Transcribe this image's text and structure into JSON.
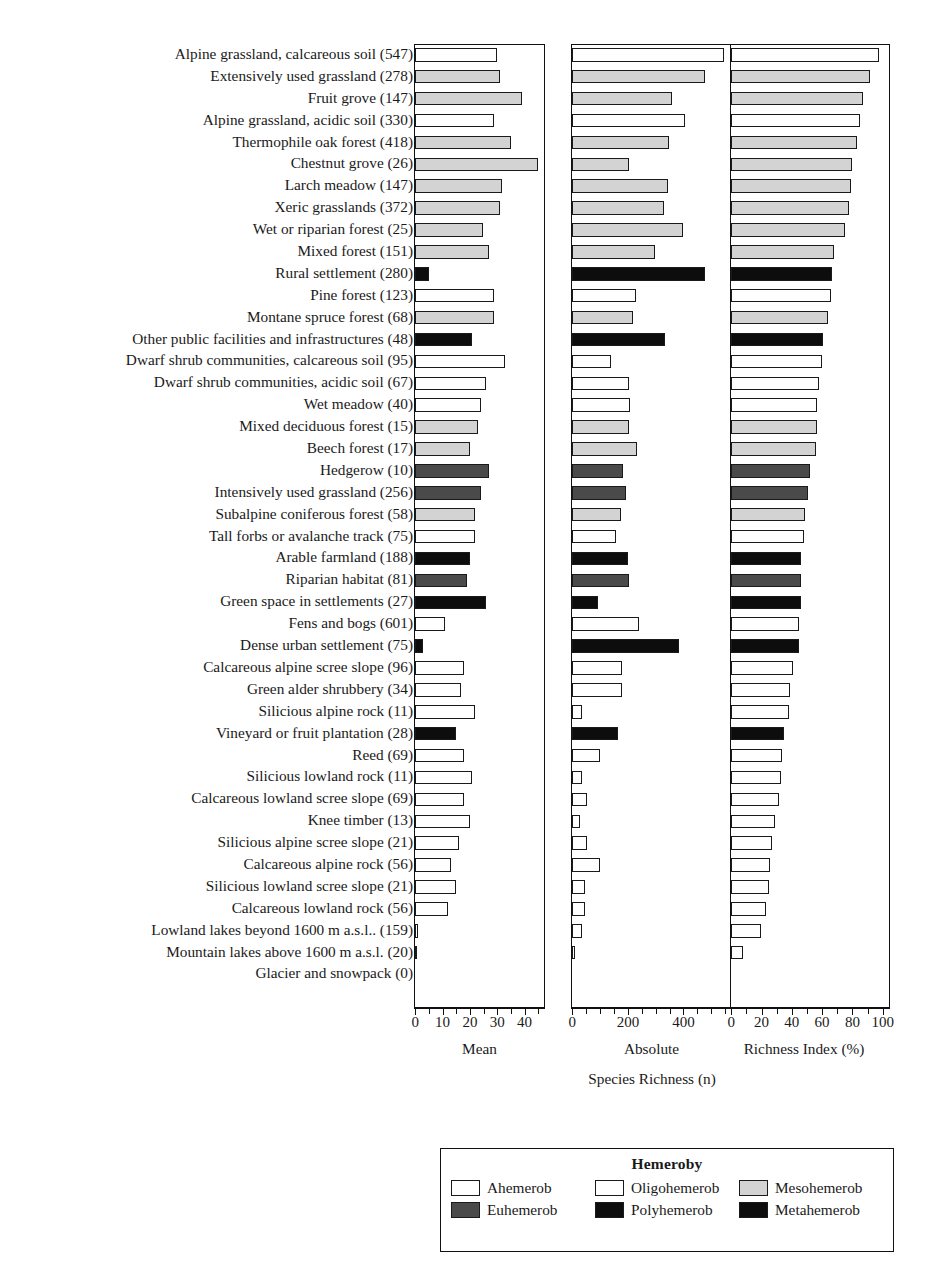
{
  "chart_data": {
    "type": "bar",
    "title": "",
    "xlabel": "Species Richness (n)",
    "ylabel": "",
    "grid": false,
    "orientation": "horizontal",
    "panels": [
      {
        "name": "Mean",
        "xlabel": "Mean",
        "xlim": [
          0,
          47
        ],
        "ticks": [
          0,
          5,
          10,
          15,
          20,
          25,
          30,
          35,
          40,
          45
        ],
        "tick_labels": [
          "0",
          "",
          "10",
          "",
          "20",
          "",
          "30",
          "",
          "40",
          ""
        ]
      },
      {
        "name": "Absolute",
        "xlabel": "Absolute",
        "xlim": [
          0,
          570
        ],
        "ticks": [
          0,
          50,
          100,
          150,
          200,
          250,
          300,
          350,
          400,
          450,
          500,
          550
        ],
        "tick_labels": [
          "0",
          "",
          "",
          "",
          "200",
          "",
          "",
          "",
          "400",
          "",
          "",
          ""
        ]
      },
      {
        "name": "Richness Index (%)",
        "xlabel": "Richness Index (%)",
        "xlim": [
          0,
          104
        ],
        "ticks": [
          0,
          10,
          20,
          30,
          40,
          50,
          60,
          70,
          80,
          90,
          100
        ],
        "tick_labels": [
          "0",
          "",
          "20",
          "",
          "40",
          "",
          "60",
          "",
          "80",
          "",
          "100"
        ]
      }
    ],
    "legend": {
      "title": "Hemeroby",
      "position": "bottom",
      "entries": [
        {
          "label": "Ahemerob",
          "key": "ahemerob",
          "color": "#ffffff"
        },
        {
          "label": "Oligohemerob",
          "key": "oligohemerob",
          "color": "#ffffff"
        },
        {
          "label": "Mesohemerob",
          "key": "mesohemerob",
          "color": "#d3d3d3"
        },
        {
          "label": "Euhemerob",
          "key": "euhemerob",
          "color": "#4a4a4a"
        },
        {
          "label": "Polyhemerob",
          "key": "polyhemerob",
          "color": "#0d0d0d"
        },
        {
          "label": "Metahemerob",
          "key": "metahemerob",
          "color": "#0d0d0d"
        }
      ]
    },
    "categories": [
      "Alpine grassland, calcareous soil (547)",
      "Extensively used grassland (278)",
      "Fruit grove (147)",
      "Alpine grassland, acidic soil (330)",
      "Thermophile oak forest (418)",
      "Chestnut grove (26)",
      "Larch meadow (147)",
      "Xeric grasslands (372)",
      "Wet or riparian forest (25)",
      "Mixed forest (151)",
      "Rural settlement (280)",
      "Pine forest (123)",
      "Montane spruce forest (68)",
      "Other public facilities and infrastructures (48)",
      "Dwarf shrub communities, calcareous soil (95)",
      "Dwarf shrub communities, acidic soil (67)",
      "Wet meadow (40)",
      "Mixed deciduous forest (15)",
      "Beech forest (17)",
      "Hedgerow (10)",
      "Intensively used grassland (256)",
      "Subalpine coniferous forest (58)",
      "Tall forbs or avalanche track (75)",
      "Arable farmland (188)",
      "Riparian habitat (81)",
      "Green space in settlements (27)",
      "Fens and bogs (601)",
      "Dense urban settlement (75)",
      "Calcareous alpine scree slope (96)",
      "Green alder shrubbery (34)",
      "Silicious alpine rock (11)",
      "Vineyard or fruit plantation (28)",
      "Reed (69)",
      "Silicious lowland rock (11)",
      "Calcareous lowland scree slope (69)",
      "Knee timber (13)",
      "Silicious alpine scree slope (21)",
      "Calcareous alpine rock (56)",
      "Silicious lowland scree slope (21)",
      "Calcareous lowland rock (56)",
      "Lowland lakes beyond 1600 m a.s.l.. (159)",
      "Mountain lakes above 1600 m a.s.l. (20)",
      "Glacier and snowpack (0)"
    ],
    "hemeroby": [
      "oligohemerob",
      "mesohemerob",
      "mesohemerob",
      "oligohemerob",
      "mesohemerob",
      "mesohemerob",
      "mesohemerob",
      "mesohemerob",
      "mesohemerob",
      "mesohemerob",
      "metahemerob",
      "oligohemerob",
      "mesohemerob",
      "metahemerob",
      "ahemerob",
      "oligohemerob",
      "oligohemerob",
      "mesohemerob",
      "mesohemerob",
      "euhemerob",
      "euhemerob",
      "mesohemerob",
      "oligohemerob",
      "metahemerob",
      "euhemerob",
      "metahemerob",
      "oligohemerob",
      "metahemerob",
      "ahemerob",
      "oligohemerob",
      "ahemerob",
      "metahemerob",
      "oligohemerob",
      "ahemerob",
      "ahemerob",
      "oligohemerob",
      "ahemerob",
      "ahemerob",
      "ahemerob",
      "ahemerob",
      "oligohemerob",
      "oligohemerob",
      "ahemerob"
    ],
    "series": [
      {
        "name": "Mean",
        "panel": 0,
        "values": [
          30,
          31,
          39,
          29,
          35,
          45,
          32,
          31,
          25,
          27,
          5,
          29,
          29,
          21,
          33,
          26,
          24,
          23,
          20,
          27,
          24,
          22,
          22,
          20,
          19,
          26,
          11,
          3,
          18,
          17,
          22,
          15,
          18,
          21,
          18,
          20,
          16,
          13,
          15,
          12,
          1,
          0.4,
          0
        ]
      },
      {
        "name": "Absolute",
        "panel": 1,
        "values": [
          547,
          478,
          360,
          406,
          350,
          205,
          345,
          330,
          400,
          300,
          480,
          230,
          220,
          335,
          140,
          205,
          210,
          205,
          235,
          185,
          195,
          175,
          160,
          200,
          205,
          95,
          240,
          385,
          180,
          180,
          35,
          165,
          100,
          35,
          55,
          30,
          55,
          100,
          45,
          45,
          35,
          12,
          0
        ]
      },
      {
        "name": "Richness Index (%)",
        "panel": 2,
        "values": [
          98,
          92,
          87,
          85,
          83,
          80,
          79,
          78,
          75,
          68,
          67,
          66,
          64,
          61,
          60,
          58,
          57,
          57,
          56,
          52,
          51,
          49,
          48,
          46,
          46,
          46,
          45,
          45,
          41,
          39,
          38,
          35,
          34,
          33,
          32,
          29,
          27,
          26,
          25,
          23,
          20,
          8,
          0
        ]
      }
    ]
  }
}
